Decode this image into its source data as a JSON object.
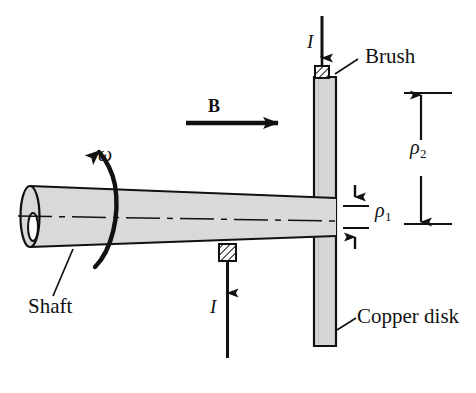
{
  "figure": {
    "colors": {
      "line": "#111111",
      "metal_fill": "#d9d9d9",
      "disk_fill": "#d4d4d4",
      "background": "#ffffff",
      "hatch": "#111111"
    },
    "labels": {
      "brush": "Brush",
      "shaft": "Shaft",
      "copper_disk": "Copper disk",
      "current_top": "I",
      "current_bottom": "I",
      "field": "B",
      "angular_velocity": "ω",
      "rho_inner_symbol": "ρ",
      "rho_inner_subscript": "1",
      "rho_outer_symbol": "ρ",
      "rho_outer_subscript": "2"
    },
    "elements": {
      "disk": {
        "name": "copper-disk",
        "x": 314,
        "y": 76,
        "width": 22,
        "height": 270
      },
      "shaft": {
        "name": "rotating-shaft",
        "left_x": 22,
        "right_x": 336,
        "axis_y": 215
      },
      "brush_top": {
        "name": "top-brush-contact",
        "x": 315,
        "y": 66,
        "width": 13,
        "height": 12
      },
      "brush_bottom": {
        "name": "bottom-brush-contact",
        "x": 218,
        "y": 245,
        "width": 16,
        "height": 16
      },
      "field_arrow": {
        "name": "magnetic-field-arrow",
        "x1": 186,
        "y1": 123,
        "x2": 290,
        "y2": 123
      },
      "rho1_dimension": {
        "name": "rho-1-dimension",
        "top_y": 196,
        "bottom_y": 238,
        "x": 355
      },
      "rho2_dimension": {
        "name": "rho-2-dimension",
        "top_y": 93,
        "bottom_y": 224,
        "x": 421
      }
    }
  }
}
